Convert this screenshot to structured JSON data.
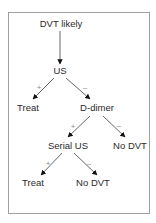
{
  "diagram": {
    "type": "decision-tree",
    "nodes": {
      "root": "DVT likely",
      "us": "US",
      "treat1": "Treat",
      "ddimer": "D-dimer",
      "serial_us": "Serial US",
      "nodvt1": "No DVT",
      "treat2": "Treat",
      "nodvt2": "No DVT"
    },
    "edges": [
      {
        "from": "root",
        "to": "us",
        "label": ""
      },
      {
        "from": "us",
        "to": "treat1",
        "label": "+"
      },
      {
        "from": "us",
        "to": "ddimer",
        "label": "–"
      },
      {
        "from": "ddimer",
        "to": "serial_us",
        "label": "+"
      },
      {
        "from": "ddimer",
        "to": "nodvt1",
        "label": "–"
      },
      {
        "from": "serial_us",
        "to": "treat2",
        "label": "+"
      },
      {
        "from": "serial_us",
        "to": "nodvt2",
        "label": "–"
      }
    ]
  }
}
